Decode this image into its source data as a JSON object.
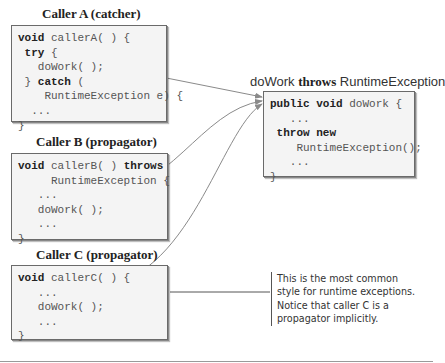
{
  "target": {
    "title_parts": [
      "doWork ",
      "throws",
      " RuntimeException"
    ],
    "code": [
      [
        {
          "t": "public void",
          "kw": true
        },
        {
          "t": " doWork {"
        }
      ],
      [
        {
          "t": "   ..."
        }
      ],
      [
        {
          "t": " throw new",
          "kw": true
        }
      ],
      [
        {
          "t": "    RuntimeException();"
        }
      ],
      [
        {
          "t": "   ..."
        }
      ],
      [
        {
          "t": "}"
        }
      ]
    ]
  },
  "callers": [
    {
      "caption": "Caller A (catcher)",
      "code": [
        [
          {
            "t": "void",
            "kw": true
          },
          {
            "t": " callerA( ) {"
          }
        ],
        [
          {
            "t": " try",
            "kw": true
          },
          {
            "t": " {"
          }
        ],
        [
          {
            "t": "   doWork( );"
          }
        ],
        [
          {
            "t": " } "
          },
          {
            "t": "catch",
            "kw": true
          },
          {
            "t": " ("
          }
        ],
        [
          {
            "t": "    RuntimeException e) {"
          }
        ],
        [
          {
            "t": "  ..."
          }
        ],
        [
          {
            "t": "}"
          }
        ]
      ]
    },
    {
      "caption": "Caller B (propagator)",
      "code": [
        [
          {
            "t": "void",
            "kw": true
          },
          {
            "t": " callerB( ) "
          },
          {
            "t": "throws",
            "kw": true
          }
        ],
        [
          {
            "t": "     RuntimeException {"
          }
        ],
        [
          {
            "t": "   ..."
          }
        ],
        [
          {
            "t": "   doWork( );"
          }
        ],
        [
          {
            "t": "   ..."
          }
        ],
        [
          {
            "t": "}"
          }
        ]
      ]
    },
    {
      "caption": "Caller C (propagator)",
      "code": [
        [
          {
            "t": "void",
            "kw": true
          },
          {
            "t": " callerC( ) {"
          }
        ],
        [
          {
            "t": "   ..."
          }
        ],
        [
          {
            "t": "   doWork( );"
          }
        ],
        [
          {
            "t": "   ..."
          }
        ],
        [
          {
            "t": "}"
          }
        ]
      ]
    }
  ],
  "note": {
    "lines": [
      "This is the most common",
      "style for runtime exceptions.",
      "Notice that caller C is a",
      "propagator implicitly."
    ]
  },
  "colors": {
    "box_bg": "#f4f4f4",
    "box_border": "#6a6a6a",
    "arrow": "#8a8a8a"
  }
}
